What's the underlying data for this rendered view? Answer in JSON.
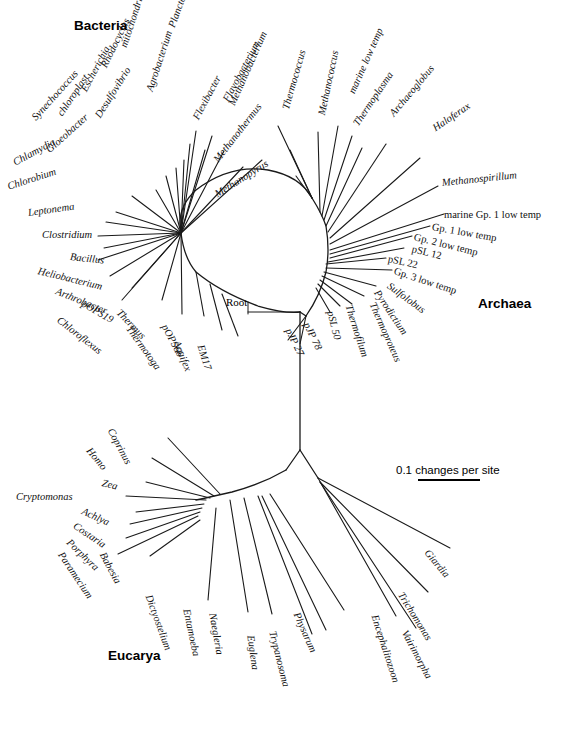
{
  "figure": {
    "type": "unrooted-phylogenetic-tree",
    "domains": [
      {
        "name": "Bacteria",
        "x": 74,
        "y": 18
      },
      {
        "name": "Archaea",
        "x": 478,
        "y": 296
      },
      {
        "name": "Eucarya",
        "x": 108,
        "y": 648
      }
    ],
    "root": {
      "label": "Root",
      "x": 248,
      "y": 302,
      "node_x": 300,
      "node_y": 312
    },
    "scale": {
      "label": "0.1 changes per site",
      "value": 0.1,
      "unit": "changes per site"
    },
    "center": {
      "x": 300,
      "y": 312
    }
  },
  "taxa": {
    "bacteria": [
      {
        "label": "Flavobacterium",
        "tx": 226,
        "ty": 96,
        "rot": -62,
        "bx": 262,
        "by": 160
      },
      {
        "label": "Flexibacter",
        "tx": 196,
        "ty": 114,
        "rot": -62,
        "bx": 236,
        "by": 172
      },
      {
        "label": "Planctomyces",
        "tx": 172,
        "ty": 22,
        "rot": -70,
        "bx": 214,
        "by": 178
      },
      {
        "label": "Agrobacterium",
        "tx": 150,
        "ty": 86,
        "rot": -72,
        "bx": 204,
        "by": 206
      },
      {
        "label": "mitochondrion",
        "tx": 124,
        "ty": 42,
        "rot": -72,
        "bx": 196,
        "by": 210
      },
      {
        "label": "Rhodocyclus",
        "tx": 104,
        "ty": 62,
        "rot": -64,
        "bx": 192,
        "by": 212
      },
      {
        "label": "Escherichia",
        "tx": 84,
        "ty": 86,
        "rot": -62,
        "bx": 190,
        "by": 214
      },
      {
        "label": "Desulfovibrio",
        "tx": 98,
        "ty": 112,
        "rot": -58,
        "bx": 188,
        "by": 216
      },
      {
        "label": "chloroplast",
        "tx": 60,
        "ty": 110,
        "rot": -56,
        "bx": 186,
        "by": 218
      },
      {
        "label": "Synechococcus",
        "tx": 34,
        "ty": 114,
        "rot": -48,
        "bx": 184,
        "by": 220
      },
      {
        "label": "Gloeobacter",
        "tx": 48,
        "ty": 146,
        "rot": -42,
        "bx": 182,
        "by": 222
      },
      {
        "label": "Chlamydia",
        "tx": 14,
        "ty": 158,
        "rot": -28,
        "bx": 180,
        "by": 226
      },
      {
        "label": "Chlorobium",
        "tx": 8,
        "ty": 182,
        "rot": -18,
        "bx": 180,
        "by": 230
      },
      {
        "label": "Leptonema",
        "tx": 28,
        "ty": 208,
        "rot": -8,
        "bx": 180,
        "by": 234
      },
      {
        "label": "Clostridium",
        "tx": 42,
        "ty": 230,
        "rot": 0,
        "bx": 180,
        "by": 238
      },
      {
        "label": "Bacillus",
        "tx": 70,
        "ty": 252,
        "rot": 6,
        "bx": 180,
        "by": 242
      },
      {
        "label": "Heliobacterium",
        "tx": 38,
        "ty": 266,
        "rot": 14,
        "bx": 182,
        "by": 246
      },
      {
        "label": "Arthrobacter",
        "tx": 56,
        "ty": 286,
        "rot": 22,
        "bx": 186,
        "by": 252
      },
      {
        "label": "pOPS19",
        "tx": 82,
        "ty": 298,
        "rot": 30,
        "bx": 192,
        "by": 258
      },
      {
        "label": "Chloroflexus",
        "tx": 58,
        "ty": 314,
        "rot": 38,
        "bx": 200,
        "by": 266
      },
      {
        "label": "Thermus",
        "tx": 118,
        "ty": 306,
        "rot": 46,
        "bx": 212,
        "by": 274
      },
      {
        "label": "Thermotoga",
        "tx": 128,
        "ty": 322,
        "rot": 54,
        "bx": 226,
        "by": 282
      },
      {
        "label": "pOPS66",
        "tx": 164,
        "ty": 320,
        "rot": 62,
        "bx": 240,
        "by": 290
      },
      {
        "label": "Aquifex",
        "tx": 176,
        "ty": 336,
        "rot": 68,
        "bx": 252,
        "by": 296
      },
      {
        "label": "EM17",
        "tx": 200,
        "ty": 340,
        "rot": 72,
        "bx": 262,
        "by": 300
      }
    ],
    "archaea": [
      {
        "label": "Methanobacterium",
        "tx": 232,
        "ty": 100,
        "rot": -66,
        "bx": 312,
        "by": 218
      },
      {
        "label": "Methanothermus",
        "tx": 216,
        "ty": 156,
        "rot": -52,
        "bx": 310,
        "by": 226
      },
      {
        "label": "Methanopyrus",
        "tx": 216,
        "ty": 190,
        "rot": -32,
        "bx": 312,
        "by": 244
      },
      {
        "label": "Thermococcus",
        "tx": 286,
        "ty": 104,
        "rot": -74,
        "bx": 328,
        "by": 222
      },
      {
        "label": "Methanococcus",
        "tx": 322,
        "ty": 110,
        "rot": -78,
        "bx": 336,
        "by": 224
      },
      {
        "label": "marine low temp",
        "tx": 352,
        "ty": 88,
        "rot": -66,
        "bx": 344,
        "by": 228
      },
      {
        "label": "Thermoplasma",
        "tx": 356,
        "ty": 120,
        "rot": -56,
        "bx": 350,
        "by": 232
      },
      {
        "label": "Archaeoglobus",
        "tx": 392,
        "ty": 110,
        "rot": -50,
        "bx": 356,
        "by": 236
      },
      {
        "label": "Haloferax",
        "tx": 434,
        "ty": 124,
        "rot": -34,
        "bx": 364,
        "by": 240
      },
      {
        "label": "Methanospirillum",
        "tx": 442,
        "ty": 178,
        "rot": -6,
        "bx": 372,
        "by": 248
      },
      {
        "label": "marine Gp. 1 low temp",
        "tx": 444,
        "ty": 210,
        "rot": 0,
        "bx": 376,
        "by": 254,
        "upright": true
      },
      {
        "label": "Gp. 1 low temp",
        "tx": 432,
        "ty": 222,
        "rot": 10,
        "bx": 378,
        "by": 258,
        "upright": true
      },
      {
        "label": "Gp. 2 low temp",
        "tx": 414,
        "ty": 232,
        "rot": 14,
        "bx": 378,
        "by": 262,
        "upright": true
      },
      {
        "label": "pSL 12",
        "tx": 412,
        "ty": 244,
        "rot": 14,
        "bx": 376,
        "by": 266,
        "upright": true
      },
      {
        "label": "pSL 22",
        "tx": 388,
        "ty": 254,
        "rot": 12,
        "bx": 372,
        "by": 270,
        "upright": true
      },
      {
        "label": "Gp. 3 low temp",
        "tx": 394,
        "ty": 266,
        "rot": 18,
        "bx": 368,
        "by": 274,
        "upright": true
      },
      {
        "label": "Sulfolobus",
        "tx": 388,
        "ty": 280,
        "rot": 36,
        "bx": 360,
        "by": 280
      },
      {
        "label": "Pyrodictium",
        "tx": 376,
        "ty": 286,
        "rot": 56,
        "bx": 352,
        "by": 286
      },
      {
        "label": "Thermoproteus",
        "tx": 372,
        "ty": 298,
        "rot": 66,
        "bx": 344,
        "by": 290
      },
      {
        "label": "Thermofilum",
        "tx": 348,
        "ty": 300,
        "rot": 72,
        "bx": 336,
        "by": 294
      },
      {
        "label": "pSL 50",
        "tx": 330,
        "ty": 306,
        "rot": 76,
        "bx": 328,
        "by": 298
      },
      {
        "label": "pJP 78",
        "tx": 306,
        "ty": 318,
        "rot": 64,
        "bx": 312,
        "by": 318
      },
      {
        "label": "pJP 27",
        "tx": 288,
        "ty": 324,
        "rot": 64,
        "bx": 302,
        "by": 322
      }
    ],
    "eucarya": [
      {
        "label": "Coprinus",
        "tx": 110,
        "ty": 424,
        "rot": 62,
        "bx": 220,
        "by": 494
      },
      {
        "label": "Homo",
        "tx": 88,
        "ty": 444,
        "rot": 50,
        "bx": 214,
        "by": 496
      },
      {
        "label": "Zea",
        "tx": 102,
        "ty": 478,
        "rot": 14,
        "bx": 210,
        "by": 498
      },
      {
        "label": "Cryptomonas",
        "tx": 16,
        "ty": 492,
        "rot": 0,
        "bx": 206,
        "by": 500
      },
      {
        "label": "Achlya",
        "tx": 82,
        "ty": 506,
        "rot": 24,
        "bx": 204,
        "by": 504
      },
      {
        "label": "Costaria",
        "tx": 74,
        "ty": 520,
        "rot": 34,
        "bx": 202,
        "by": 508
      },
      {
        "label": "Porphyra",
        "tx": 68,
        "ty": 536,
        "rot": 44,
        "bx": 200,
        "by": 512
      },
      {
        "label": "Paramecium",
        "tx": 60,
        "ty": 548,
        "rot": 56,
        "bx": 198,
        "by": 516
      },
      {
        "label": "Babesia",
        "tx": 102,
        "ty": 548,
        "rot": 62,
        "bx": 202,
        "by": 520
      },
      {
        "label": "Dictyostelium",
        "tx": 148,
        "ty": 590,
        "rot": 70,
        "bx": 216,
        "by": 524
      },
      {
        "label": "Entamoeba",
        "tx": 186,
        "ty": 604,
        "rot": 78,
        "bx": 230,
        "by": 526
      },
      {
        "label": "Naegleria",
        "tx": 212,
        "ty": 608,
        "rot": 80,
        "bx": 244,
        "by": 528
      },
      {
        "label": "Euglena",
        "tx": 250,
        "ty": 630,
        "rot": 82,
        "bx": 258,
        "by": 526
      },
      {
        "label": "Trypanosoma",
        "tx": 272,
        "ty": 626,
        "rot": 76,
        "bx": 264,
        "by": 524
      },
      {
        "label": "Physarum",
        "tx": 296,
        "ty": 608,
        "rot": 66,
        "bx": 272,
        "by": 522
      },
      {
        "label": "Encephalitozoon",
        "tx": 374,
        "ty": 610,
        "rot": 72,
        "bx": 310,
        "by": 506
      },
      {
        "label": "Vairimorpha",
        "tx": 404,
        "ty": 626,
        "rot": 62,
        "bx": 318,
        "by": 502
      },
      {
        "label": "Trichomonas",
        "tx": 400,
        "ty": 588,
        "rot": 58,
        "bx": 322,
        "by": 498
      },
      {
        "label": "Giardia",
        "tx": 426,
        "ty": 546,
        "rot": 50,
        "bx": 330,
        "by": 488
      }
    ]
  },
  "style": {
    "stroke": "#1a1a1a",
    "background": "#ffffff"
  }
}
